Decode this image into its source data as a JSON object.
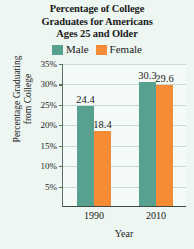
{
  "chart_data": {
    "type": "bar",
    "title": "Percentage of College Graduates for Americans Ages 25 and Older",
    "title_lines": [
      "Percentage of College",
      "Graduates for Americans",
      "Ages 25 and Older"
    ],
    "xlabel": "Year",
    "ylabel": "Percentage Graduating from College",
    "ylabel_lines": [
      "Percentage Graduating",
      "from College"
    ],
    "categories": [
      "1990",
      "2010"
    ],
    "series": [
      {
        "name": "Male",
        "values": [
          24.4,
          18.4
        ],
        "color": "#56a18f"
      },
      {
        "name": "Female",
        "values": [
          null,
          null
        ],
        "color": "#f58b34"
      }
    ],
    "bars": [
      {
        "category": "1990",
        "series": "Male",
        "value": 24.4,
        "label": "24.4",
        "color": "#56a18f"
      },
      {
        "category": "1990",
        "series": "Female",
        "value": 18.4,
        "label": "18.4",
        "color": "#f58b34"
      },
      {
        "category": "2010",
        "series": "Male",
        "value": 30.3,
        "label": "30.3",
        "color": "#56a18f"
      },
      {
        "category": "2010",
        "series": "Female",
        "value": 29.6,
        "label": "29.6",
        "color": "#f58b34"
      }
    ],
    "yticks": [
      "5%",
      "10%",
      "15%",
      "20%",
      "25%",
      "30%",
      "35%"
    ],
    "ytick_values": [
      5,
      10,
      15,
      20,
      25,
      30,
      35
    ],
    "ylim": [
      0,
      35
    ],
    "grid": true,
    "legend_position": "top"
  },
  "legend": {
    "entries": [
      {
        "label": "Male",
        "color": "#56a18f"
      },
      {
        "label": "Female",
        "color": "#f58b34"
      }
    ]
  },
  "colors": {
    "male": "#56a18f",
    "female": "#f58b34",
    "background": "#eef6f2",
    "plot_background": "#f4faf7",
    "gridline": "#c8d8d2",
    "axis": "#3d4a46",
    "text": "#1a1a1a"
  }
}
